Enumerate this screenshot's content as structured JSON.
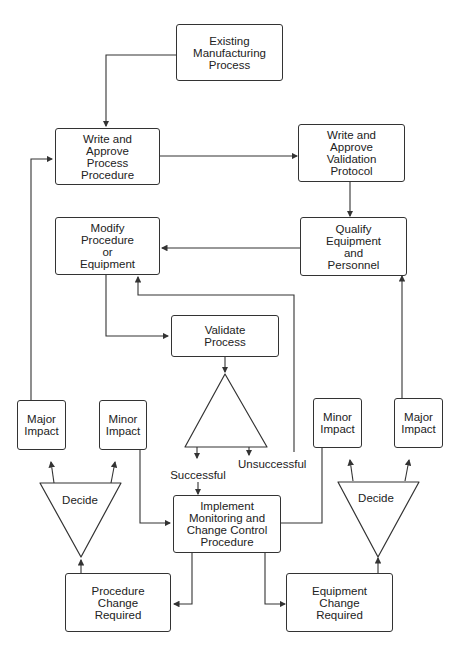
{
  "diagram": {
    "nodes": {
      "existing": "Existing\nManufacturing\nProcess",
      "write_procedure": "Write and\nApprove\nProcess\nProcedure",
      "write_protocol": "Write and\nApprove\nValidation\nProtocol",
      "modify": "Modify\nProcedure\nor\nEquipment",
      "qualify": "Qualify\nEquipment\nand\nPersonnel",
      "validate": "Validate\nProcess",
      "major_left": "Major\nImpact",
      "minor_left": "Minor\nImpact",
      "minor_right": "Minor\nImpact",
      "major_right": "Major\nImpact",
      "implement": "Implement\nMonitoring and\nChange Control\nProcedure",
      "procedure_change": "Procedure\nChange\nRequired",
      "equipment_change": "Equipment\nChange\nRequired"
    },
    "labels": {
      "successful": "Successful",
      "unsuccessful": "Unsuccessful",
      "decide_left": "Decide",
      "decide_right": "Decide"
    },
    "colors": {
      "stroke": "#333333",
      "background": "#ffffff"
    }
  }
}
